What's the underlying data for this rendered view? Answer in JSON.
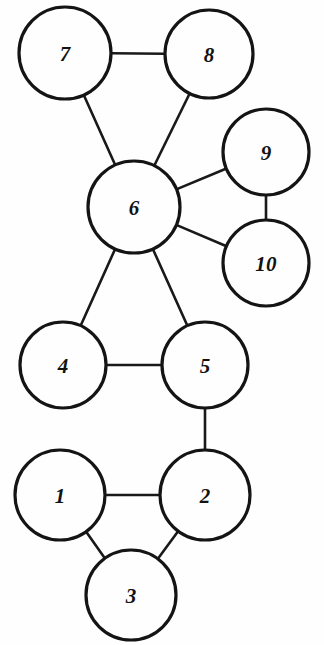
{
  "diagram": {
    "background_color": "#fefefe",
    "stroke_color": "#141414",
    "edge_color": "#191919",
    "node_fill": "#fefefe",
    "width": 324,
    "height": 645
  },
  "chart_data": {
    "type": "diagram",
    "graph_kind": "undirected-node-link-graph",
    "title": "",
    "nodes": [
      {
        "id": "1",
        "label": "1",
        "cx": 60,
        "cy": 495,
        "r": 45
      },
      {
        "id": "2",
        "label": "2",
        "cx": 205,
        "cy": 495,
        "r": 45
      },
      {
        "id": "3",
        "label": "3",
        "cx": 131,
        "cy": 595,
        "r": 45
      },
      {
        "id": "4",
        "label": "4",
        "cx": 63,
        "cy": 365,
        "r": 43
      },
      {
        "id": "5",
        "label": "5",
        "cx": 205,
        "cy": 365,
        "r": 43
      },
      {
        "id": "6",
        "label": "6",
        "cx": 134,
        "cy": 207,
        "r": 46
      },
      {
        "id": "7",
        "label": "7",
        "cx": 65,
        "cy": 53,
        "r": 46
      },
      {
        "id": "8",
        "label": "8",
        "cx": 209,
        "cy": 54,
        "r": 44
      },
      {
        "id": "9",
        "label": "9",
        "cx": 266,
        "cy": 152,
        "r": 43
      },
      {
        "id": "10",
        "label": "10",
        "cx": 266,
        "cy": 263,
        "r": 43
      }
    ],
    "edges": [
      {
        "source": "7",
        "target": "8"
      },
      {
        "source": "7",
        "target": "6"
      },
      {
        "source": "8",
        "target": "6"
      },
      {
        "source": "6",
        "target": "9"
      },
      {
        "source": "6",
        "target": "10"
      },
      {
        "source": "9",
        "target": "10"
      },
      {
        "source": "6",
        "target": "4"
      },
      {
        "source": "6",
        "target": "5"
      },
      {
        "source": "4",
        "target": "5"
      },
      {
        "source": "5",
        "target": "2"
      },
      {
        "source": "1",
        "target": "2"
      },
      {
        "source": "1",
        "target": "3"
      },
      {
        "source": "2",
        "target": "3"
      }
    ],
    "node_count": 10,
    "edge_count": 13,
    "legend": [],
    "annotations": []
  }
}
